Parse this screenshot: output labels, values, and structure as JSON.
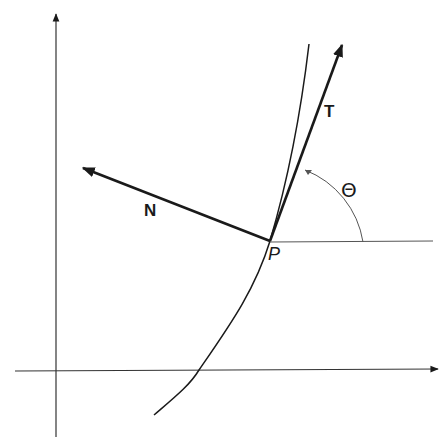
{
  "diagram": {
    "title": "",
    "labels": {
      "tangent": "T",
      "normal": "N",
      "point": "P",
      "angle": "Θ"
    },
    "colors": {
      "ink": "#1a1a1a",
      "thin_line": "#555555",
      "background": "#ffffff"
    },
    "elements": [
      {
        "id": "y-axis",
        "type": "arrow",
        "from": [
          56,
          437
        ],
        "to": [
          56,
          12
        ]
      },
      {
        "id": "x-axis",
        "type": "arrow",
        "from": [
          15,
          371
        ],
        "to": [
          440,
          369
        ]
      },
      {
        "id": "curve",
        "type": "curve",
        "from": [
          154,
          415
        ],
        "through": [
          270,
          241
        ],
        "to": [
          309,
          44
        ]
      },
      {
        "id": "tangent-vector",
        "label": "T",
        "type": "arrow",
        "from": [
          270,
          241
        ],
        "to": [
          343,
          42
        ]
      },
      {
        "id": "normal-vector",
        "label": "N",
        "type": "arrow",
        "from": [
          270,
          241
        ],
        "to": [
          80,
          167
        ]
      },
      {
        "id": "horizontal-reference",
        "type": "line",
        "from": [
          270,
          242
        ],
        "to": [
          433,
          241
        ]
      },
      {
        "id": "angle-arc",
        "label": "Θ",
        "type": "arc",
        "from": [
          363,
          242
        ],
        "to": [
          305,
          170
        ]
      }
    ]
  }
}
